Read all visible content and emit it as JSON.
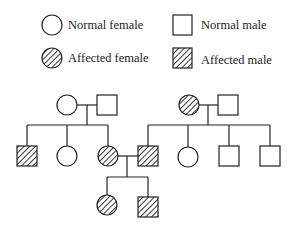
{
  "legend": {
    "items": [
      {
        "label": "Normal female",
        "symbol": "circle",
        "affected": false
      },
      {
        "label": "Normal male",
        "symbol": "square",
        "affected": false
      },
      {
        "label": "Affected female",
        "symbol": "circle",
        "affected": true
      },
      {
        "label": "Affected male",
        "symbol": "square",
        "affected": true
      }
    ]
  },
  "pedigree": {
    "generations": [
      {
        "id": "I",
        "individuals": [
          {
            "id": "I-1",
            "sex": "female",
            "affected": false
          },
          {
            "id": "I-2",
            "sex": "male",
            "affected": false
          },
          {
            "id": "I-3",
            "sex": "female",
            "affected": true
          },
          {
            "id": "I-4",
            "sex": "male",
            "affected": false
          }
        ]
      },
      {
        "id": "II",
        "individuals": [
          {
            "id": "II-1",
            "sex": "male",
            "affected": true,
            "parents": [
              "I-1",
              "I-2"
            ]
          },
          {
            "id": "II-2",
            "sex": "female",
            "affected": false,
            "parents": [
              "I-1",
              "I-2"
            ]
          },
          {
            "id": "II-3",
            "sex": "female",
            "affected": true,
            "parents": [
              "I-1",
              "I-2"
            ]
          },
          {
            "id": "II-4",
            "sex": "male",
            "affected": true,
            "parents": [
              "I-3",
              "I-4"
            ]
          },
          {
            "id": "II-5",
            "sex": "female",
            "affected": false,
            "parents": [
              "I-3",
              "I-4"
            ]
          },
          {
            "id": "II-6",
            "sex": "male",
            "affected": false,
            "parents": [
              "I-3",
              "I-4"
            ]
          },
          {
            "id": "II-7",
            "sex": "male",
            "affected": false,
            "parents": [
              "I-3",
              "I-4"
            ]
          }
        ]
      },
      {
        "id": "III",
        "individuals": [
          {
            "id": "III-1",
            "sex": "female",
            "affected": true,
            "parents": [
              "II-3",
              "II-4"
            ]
          },
          {
            "id": "III-2",
            "sex": "male",
            "affected": true,
            "parents": [
              "II-3",
              "II-4"
            ]
          }
        ]
      }
    ],
    "matings": [
      [
        "I-1",
        "I-2"
      ],
      [
        "I-3",
        "I-4"
      ],
      [
        "II-3",
        "II-4"
      ]
    ]
  },
  "colors": {
    "stroke": "#222222",
    "fill": "#ffffff",
    "hatch": "#222222"
  }
}
